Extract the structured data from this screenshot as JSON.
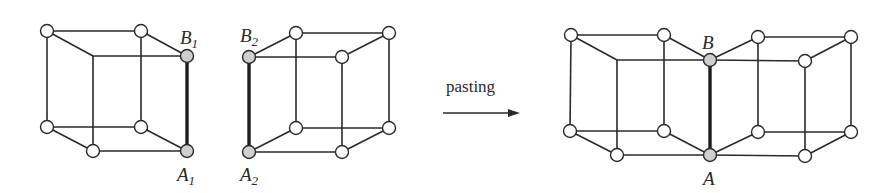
{
  "figure": {
    "operation_label": "pasting",
    "colors": {
      "line": "#2a2a2a",
      "node_fill": "#ffffff",
      "marked_node_fill": "#cfcfcf",
      "background": "#ffffff"
    },
    "cube1": {
      "labels": {
        "top": {
          "base": "B",
          "sub": "1"
        },
        "bottom": {
          "base": "A",
          "sub": "1"
        }
      },
      "nodes": [
        [
          47,
          31
        ],
        [
          141,
          31
        ],
        [
          187,
          56
        ],
        [
          47,
          127
        ],
        [
          141,
          127
        ],
        [
          93,
          151
        ],
        [
          187,
          151
        ]
      ],
      "marked_nodes": [
        [
          187,
          56
        ],
        [
          187,
          151
        ]
      ],
      "hidden_corner": [
        93,
        56
      ]
    },
    "cube2": {
      "labels": {
        "top": {
          "base": "B",
          "sub": "2"
        },
        "bottom": {
          "base": "A",
          "sub": "2"
        }
      },
      "nodes": [
        [
          296,
          33
        ],
        [
          389,
          33
        ],
        [
          342,
          57
        ],
        [
          296,
          128
        ],
        [
          389,
          128
        ],
        [
          342,
          152
        ]
      ],
      "marked_nodes": [
        [
          249,
          57
        ],
        [
          249,
          152
        ]
      ]
    },
    "result": {
      "labels": {
        "top": "B",
        "bottom": "A"
      },
      "marked_nodes": [
        [
          710,
          60
        ],
        [
          710,
          155
        ]
      ]
    }
  }
}
